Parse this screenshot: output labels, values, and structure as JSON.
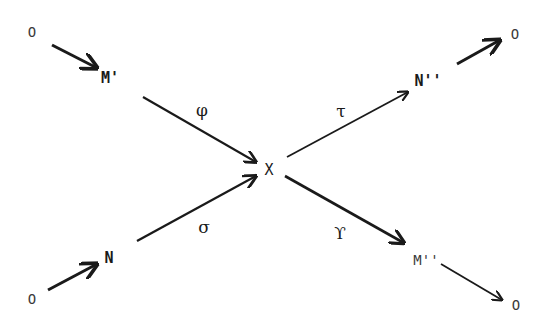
{
  "diagram": {
    "type": "directed-graph",
    "nodes": {
      "o_top_left": "O",
      "m_prime": "M'",
      "x_center": "X",
      "n_double_prime": "N''",
      "o_top_right": "O",
      "o_bottom_left": "O",
      "n": "N",
      "m_double_prime": "M''",
      "o_bottom_right": "O"
    },
    "edge_labels": {
      "phi": "φ",
      "tau": "τ",
      "sigma": "σ",
      "upsilon": "ϒ"
    },
    "edges": [
      {
        "from": "O",
        "to": "M'",
        "label": ""
      },
      {
        "from": "M'",
        "to": "X",
        "label": "φ"
      },
      {
        "from": "N",
        "to": "X",
        "label": "σ"
      },
      {
        "from": "O",
        "to": "N",
        "label": ""
      },
      {
        "from": "X",
        "to": "N''",
        "label": "τ"
      },
      {
        "from": "N''",
        "to": "O",
        "label": ""
      },
      {
        "from": "X",
        "to": "M''",
        "label": "ϒ"
      },
      {
        "from": "M''",
        "to": "O",
        "label": ""
      }
    ],
    "colors": {
      "ink": "#1a1a1a",
      "background": "#ffffff"
    }
  }
}
